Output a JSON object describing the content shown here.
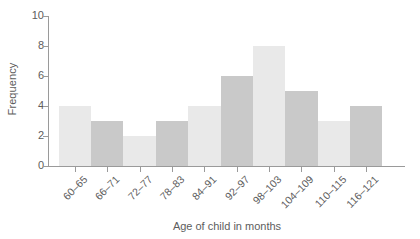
{
  "chart_data": {
    "type": "bar",
    "title": "",
    "xlabel": "Age of child in months",
    "ylabel": "Frequency",
    "categories": [
      "60–65",
      "66–71",
      "72–77",
      "78–83",
      "84–91",
      "92–97",
      "98–103",
      "104–109",
      "110–115",
      "116–121"
    ],
    "values": [
      4,
      3,
      2,
      3,
      4,
      6,
      8,
      5,
      3,
      4
    ],
    "ylim": [
      0,
      10
    ],
    "yticks": [
      0,
      2,
      4,
      6,
      8,
      10
    ],
    "ytick_labels": [
      "0",
      "2",
      "4",
      "6",
      "8",
      "10"
    ],
    "grid": false,
    "legend": null,
    "bar_colors": [
      "#e9e9e9",
      "#c9c9c9",
      "#e9e9e9",
      "#c9c9c9",
      "#e9e9e9",
      "#c9c9c9",
      "#e9e9e9",
      "#c9c9c9",
      "#e9e9e9",
      "#c9c9c9"
    ],
    "axis_color": "#9a9a9a",
    "text_color": "#5d5d5d",
    "background": "#ffffff",
    "xtick_label_rotation": -45
  }
}
